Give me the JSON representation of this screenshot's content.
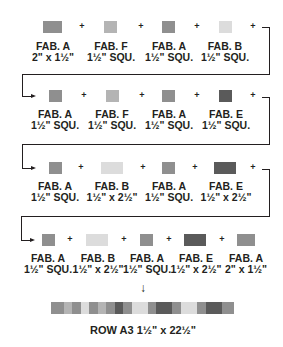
{
  "diagram": {
    "colors": {
      "A": "#8f8f8f",
      "B": "#dcdcdc",
      "E": "#5a5a5a",
      "F": "#b4b4b4"
    },
    "rows": [
      {
        "pieces": [
          {
            "fabric": "FAB. A",
            "size": "2\" x 1½\""
          },
          {
            "fabric": "FAB. F",
            "size": "1½\" SQU."
          },
          {
            "fabric": "FAB. A",
            "size": "1½\" SQU."
          },
          {
            "fabric": "FAB. B",
            "size": "1½\" SQU."
          }
        ]
      },
      {
        "pieces": [
          {
            "fabric": "FAB. A",
            "size": "1½\" SQU."
          },
          {
            "fabric": "FAB. F",
            "size": "1½\" SQU."
          },
          {
            "fabric": "FAB. A",
            "size": "1½\" SQU."
          },
          {
            "fabric": "FAB. E",
            "size": "1½\" SQU."
          }
        ]
      },
      {
        "pieces": [
          {
            "fabric": "FAB. A",
            "size": "1½\" SQU."
          },
          {
            "fabric": "FAB. B",
            "size": "1½\" x 2½\""
          },
          {
            "fabric": "FAB. A",
            "size": "1½\" SQU."
          },
          {
            "fabric": "FAB. E",
            "size": "1½\" x 2½\""
          }
        ]
      },
      {
        "pieces": [
          {
            "fabric": "FAB. A",
            "size": "1½\" SQU."
          },
          {
            "fabric": "FAB. B",
            "size": "1½\" x 2½\""
          },
          {
            "fabric": "FAB. A",
            "size": "1½\" SQU."
          },
          {
            "fabric": "FAB. E",
            "size": "1½\" x 2½\""
          },
          {
            "fabric": "FAB. A",
            "size": "2\" x 1½\""
          }
        ]
      }
    ],
    "plus_symbol": "+",
    "down_arrow": "↓",
    "result_label": "ROW A3 1½\" x 22½\""
  }
}
